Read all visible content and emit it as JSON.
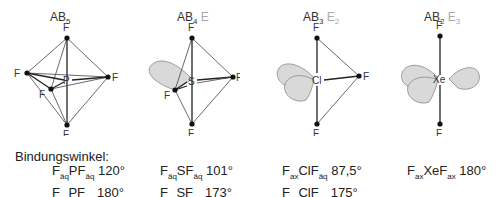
{
  "molecules": [
    {
      "formula_base": "AB",
      "b_sub": "5",
      "lp": "",
      "lp_sub": "",
      "center": "P",
      "angles": [
        {
          "f1_sub": "äq",
          "mid": "P",
          "f2_sub": "äq",
          "value": "120°"
        },
        {
          "f1_sub": "ax",
          "mid": "P",
          "f2_sub": "ax",
          "value": "180°"
        }
      ]
    },
    {
      "formula_base": "AB",
      "b_sub": "4",
      "lp": "E",
      "lp_sub": "",
      "center": "S",
      "angles": [
        {
          "f1_sub": "äq",
          "mid": "S",
          "f2_sub": "äq",
          "value": "101°"
        },
        {
          "f1_sub": "ax",
          "mid": "S",
          "f2_sub": "ax",
          "value": "173°"
        }
      ]
    },
    {
      "formula_base": "AB",
      "b_sub": "3",
      "lp": "E",
      "lp_sub": "2",
      "center": "Cl",
      "angles": [
        {
          "f1_sub": "ax",
          "mid": "Cl",
          "f2_sub": "äq",
          "value": "87,5°"
        },
        {
          "f1_sub": "ax",
          "mid": "Cl",
          "f2_sub": "ax",
          "value": "175°"
        }
      ]
    },
    {
      "formula_base": "AB",
      "b_sub": "2",
      "lp": "E",
      "lp_sub": "3",
      "center": "Xe",
      "angles": [
        {
          "f1_sub": "ax",
          "mid": "Xe",
          "f2_sub": "ax",
          "value": "180°"
        }
      ]
    }
  ],
  "ligand": "F",
  "angles_heading": "Bindungswinkel:",
  "colors": {
    "lone_pair_fill": "#d9d9d9",
    "lone_pair_label": "#aaaaaa"
  }
}
